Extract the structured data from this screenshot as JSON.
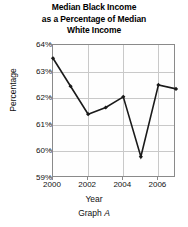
{
  "title": {
    "line1": "Median Black Income",
    "line2": "as a Percentage of Median",
    "line3": "White Income"
  },
  "caption": {
    "prefix": "Graph",
    "id": "A"
  },
  "axes": {
    "ylabel": "Percentage",
    "xlabel": "Year",
    "yticks": [
      "59%",
      "60%",
      "61%",
      "62%",
      "63%",
      "64%"
    ],
    "xticks": [
      "2000",
      "2002",
      "2004",
      "2006"
    ]
  },
  "chart_data": {
    "type": "line",
    "title": "Median Black Income as a Percentage of Median White Income",
    "xlabel": "Year",
    "ylabel": "Percentage",
    "x": [
      2000,
      2001,
      2002,
      2003,
      2004,
      2005,
      2006,
      2007
    ],
    "values": [
      63.5,
      62.45,
      61.4,
      61.65,
      62.05,
      59.8,
      62.5,
      62.35
    ],
    "xlim": [
      2000,
      2007
    ],
    "ylim": [
      59,
      64
    ],
    "ytick_values": [
      59,
      60,
      61,
      62,
      63,
      64
    ],
    "xtick_values": [
      2000,
      2002,
      2004,
      2006
    ],
    "grid": true,
    "legend": "none",
    "marker": "filled-diamond",
    "line_color": "#1a1a1a"
  }
}
